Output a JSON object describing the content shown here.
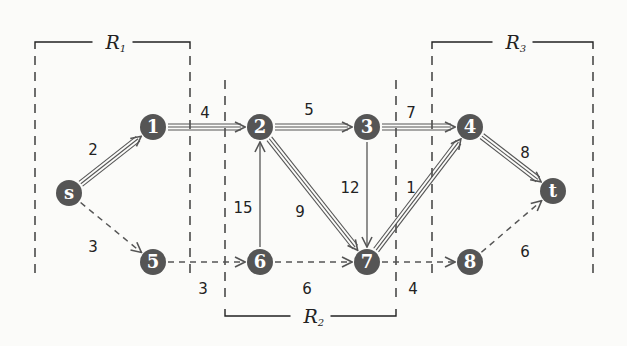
{
  "colors": {
    "node_fill": "#555555",
    "node_text": "#ffffff",
    "edge": "#555555",
    "region": "#222222",
    "background": "#fbfbf9"
  },
  "nodes": [
    {
      "id": "s",
      "label": "s",
      "x": 69,
      "y": 193
    },
    {
      "id": "1",
      "label": "1",
      "x": 153,
      "y": 127
    },
    {
      "id": "2",
      "label": "2",
      "x": 260,
      "y": 127
    },
    {
      "id": "3",
      "label": "3",
      "x": 367,
      "y": 127
    },
    {
      "id": "4",
      "label": "4",
      "x": 470,
      "y": 127
    },
    {
      "id": "t",
      "label": "t",
      "x": 553,
      "y": 191
    },
    {
      "id": "5",
      "label": "5",
      "x": 153,
      "y": 262
    },
    {
      "id": "6",
      "label": "6",
      "x": 260,
      "y": 262
    },
    {
      "id": "7",
      "label": "7",
      "x": 367,
      "y": 262
    },
    {
      "id": "8",
      "label": "8",
      "x": 470,
      "y": 262
    }
  ],
  "edges": [
    {
      "from": "s",
      "to": "1",
      "weight": "2",
      "style": "triple",
      "label_x": 93,
      "label_y": 150
    },
    {
      "from": "1",
      "to": "2",
      "weight": "4",
      "style": "triple",
      "label_x": 205,
      "label_y": 113
    },
    {
      "from": "2",
      "to": "3",
      "weight": "5",
      "style": "triple",
      "label_x": 309,
      "label_y": 110
    },
    {
      "from": "3",
      "to": "4",
      "weight": "7",
      "style": "triple",
      "label_x": 411,
      "label_y": 113
    },
    {
      "from": "4",
      "to": "t",
      "weight": "8",
      "style": "triple",
      "label_x": 525,
      "label_y": 153
    },
    {
      "from": "2",
      "to": "7",
      "weight": "9",
      "style": "triple",
      "label_x": 300,
      "label_y": 212
    },
    {
      "from": "7",
      "to": "4",
      "weight": "1",
      "style": "triple",
      "label_x": 411,
      "label_y": 188
    },
    {
      "from": "6",
      "to": "2",
      "weight": "15",
      "style": "solid",
      "label_x": 243,
      "label_y": 208
    },
    {
      "from": "3",
      "to": "7",
      "weight": "12",
      "style": "solid",
      "label_x": 350,
      "label_y": 188
    },
    {
      "from": "s",
      "to": "5",
      "weight": "3",
      "style": "dashed",
      "label_x": 93,
      "label_y": 247
    },
    {
      "from": "5",
      "to": "6",
      "weight": "3",
      "style": "dashed",
      "label_x": 203,
      "label_y": 289
    },
    {
      "from": "6",
      "to": "7",
      "weight": "6",
      "style": "dashed",
      "label_x": 307,
      "label_y": 289
    },
    {
      "from": "7",
      "to": "8",
      "weight": "4",
      "style": "dashed",
      "label_x": 413,
      "label_y": 289
    },
    {
      "from": "8",
      "to": "t",
      "weight": "6",
      "style": "dashed",
      "label_x": 525,
      "label_y": 252
    }
  ],
  "regions": [
    {
      "id": "R1",
      "label": "R",
      "sub": "1",
      "x1": 35,
      "x2": 190,
      "bracket_y": 42,
      "bracket_side": "top",
      "line_y1": 56,
      "line_y2": 276
    },
    {
      "id": "R2",
      "label": "R",
      "sub": "2",
      "x1": 225,
      "x2": 396,
      "bracket_y": 316,
      "bracket_side": "bottom",
      "line_y1": 80,
      "line_y2": 302
    },
    {
      "id": "R3",
      "label": "R",
      "sub": "3",
      "x1": 432,
      "x2": 593,
      "bracket_y": 42,
      "bracket_side": "top",
      "line_y1": 56,
      "line_y2": 276
    }
  ]
}
